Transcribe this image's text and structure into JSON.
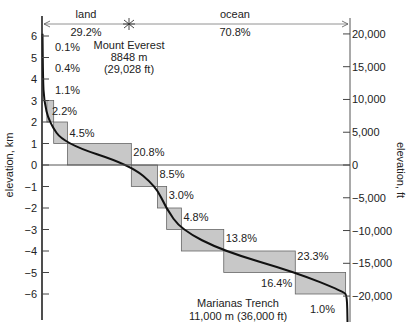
{
  "chart_data": {
    "type": "area",
    "ylabel_left": "elevation, km",
    "ylabel_right": "elevation, ft",
    "ylim_km": [
      -6,
      6
    ],
    "left_ticks": [
      6,
      5,
      4,
      3,
      2,
      1,
      0,
      -1,
      -2,
      -3,
      -4,
      -5,
      -6
    ],
    "left_tick_labels": [
      "6",
      "5",
      "4",
      "3",
      "2",
      "1",
      "0",
      "−1",
      "−2",
      "−3",
      "−4",
      "−5",
      "−6"
    ],
    "right_ticks": [
      20000,
      15000,
      10000,
      5000,
      0,
      -5000,
      -10000,
      -15000,
      -20000
    ],
    "right_tick_labels": [
      "20,000",
      "15,000",
      "10,000",
      "5,000",
      "0",
      "−5,000",
      "−10,000",
      "−15,000",
      "−20,000"
    ],
    "top_bands": [
      {
        "label": "land",
        "percent": "29.2%"
      },
      {
        "label": "ocean",
        "percent": "70.8%"
      }
    ],
    "bins": [
      {
        "range_km": [
          5,
          6
        ],
        "percent": 0.1,
        "label": "0.1%"
      },
      {
        "range_km": [
          4,
          5
        ],
        "percent": 0.4,
        "label": "0.4%"
      },
      {
        "range_km": [
          3,
          4
        ],
        "percent": 1.1,
        "label": "1.1%"
      },
      {
        "range_km": [
          2,
          3
        ],
        "percent": 2.2,
        "label": "2.2%"
      },
      {
        "range_km": [
          1,
          2
        ],
        "percent": 4.5,
        "label": "4.5%"
      },
      {
        "range_km": [
          0,
          1
        ],
        "percent": 20.8,
        "label": "20.8%"
      },
      {
        "range_km": [
          -1,
          0
        ],
        "percent": 8.5,
        "label": "8.5%"
      },
      {
        "range_km": [
          -2,
          -1
        ],
        "percent": 3.0,
        "label": "3.0%"
      },
      {
        "range_km": [
          -3,
          -2
        ],
        "percent": 4.8,
        "label": "4.8%"
      },
      {
        "range_km": [
          -4,
          -3
        ],
        "percent": 13.8,
        "label": "13.8%"
      },
      {
        "range_km": [
          -5,
          -4
        ],
        "percent": 23.3,
        "label": "23.3%"
      },
      {
        "range_km": [
          -6,
          -5
        ],
        "percent": 16.4,
        "label": "16.4%"
      },
      {
        "range_km": [
          -11,
          -6
        ],
        "percent": 1.0,
        "label": "1.0%"
      }
    ],
    "annotations": [
      {
        "id": "everest",
        "lines": [
          "Mount Everest",
          "8848 m",
          "(29,028 ft)"
        ]
      },
      {
        "id": "marianas",
        "lines": [
          "Marianas Trench",
          "11,000 m (36,000 ft)"
        ]
      }
    ],
    "grid": false
  }
}
